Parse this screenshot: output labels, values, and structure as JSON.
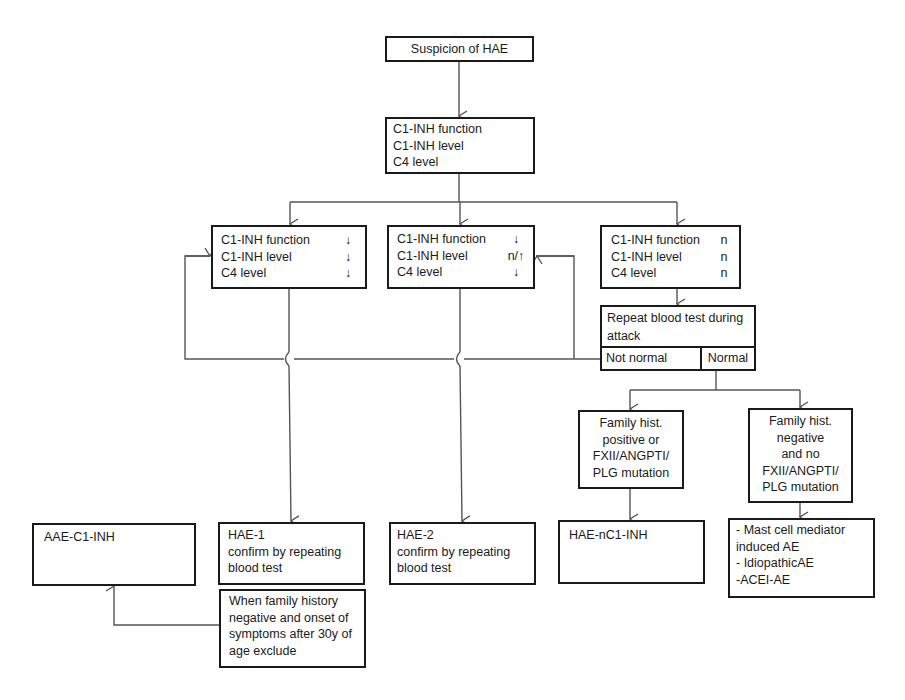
{
  "diagram": {
    "type": "flowchart",
    "nodes": {
      "suspicion": {
        "text": "Suspicion of HAE"
      },
      "initial_tests": {
        "lines": [
          "C1-INH function",
          "C1-INH level",
          "C4 level"
        ]
      },
      "result_type1": {
        "rows": [
          {
            "label": "C1-INH function",
            "value": "↓"
          },
          {
            "label": "C1-INH level",
            "value": "↓"
          },
          {
            "label": "C4 level",
            "value": "↓"
          }
        ]
      },
      "result_type2": {
        "rows": [
          {
            "label": "C1-INH function",
            "value": "↓"
          },
          {
            "label": "C1-INH level",
            "value": "n/↑"
          },
          {
            "label": "C4 level",
            "value": "↓"
          }
        ]
      },
      "result_normal": {
        "rows": [
          {
            "label": "C1-INH function",
            "value": "n"
          },
          {
            "label": "C1-INH level",
            "value": "n"
          },
          {
            "label": "C4 level",
            "value": "n"
          }
        ]
      },
      "repeat_test": {
        "lines": [
          "Repeat blood test during",
          "attack"
        ],
        "not_normal": "Not normal",
        "normal": "Normal"
      },
      "family_positive": {
        "lines": [
          "Family hist.",
          "positive or",
          "FXII/ANGPTI/",
          "PLG mutation"
        ]
      },
      "family_negative": {
        "lines": [
          "Family hist.",
          "negative",
          "and no",
          "FXII/ANGPTI/",
          "PLG mutation"
        ]
      },
      "aae": {
        "lines": [
          "AAE-C1-INH"
        ]
      },
      "hae1": {
        "lines": [
          "HAE-1",
          "confirm by repeating",
          "blood test"
        ]
      },
      "hae1_exclusion": {
        "lines": [
          "When family history",
          "negative and onset of",
          "symptoms after 30y of",
          "age exclude"
        ]
      },
      "hae2": {
        "lines": [
          "HAE-2",
          "confirm by repeating",
          "blood test"
        ]
      },
      "hae_nc1": {
        "lines": [
          "HAE-nC1-INH"
        ]
      },
      "other_ae": {
        "lines": [
          "- Mast cell mediator",
          "induced AE",
          "- IdiopathicAE",
          "-ACEI-AE"
        ]
      }
    },
    "edges": [
      {
        "from": "suspicion",
        "to": "initial_tests"
      },
      {
        "from": "initial_tests",
        "to": "result_type1"
      },
      {
        "from": "initial_tests",
        "to": "result_type2"
      },
      {
        "from": "initial_tests",
        "to": "result_normal"
      },
      {
        "from": "result_normal",
        "to": "repeat_test"
      },
      {
        "from": "repeat_test.not_normal",
        "to": "result_type1"
      },
      {
        "from": "repeat_test.not_normal",
        "to": "result_type2"
      },
      {
        "from": "repeat_test.normal",
        "to": "family_positive"
      },
      {
        "from": "repeat_test.normal",
        "to": "family_negative"
      },
      {
        "from": "result_type1",
        "to": "hae1"
      },
      {
        "from": "result_type2",
        "to": "hae2"
      },
      {
        "from": "family_positive",
        "to": "hae_nc1"
      },
      {
        "from": "family_negative",
        "to": "other_ae"
      },
      {
        "from": "hae1_exclusion",
        "to": "aae"
      }
    ],
    "colors": {
      "line": "#555555",
      "border": "#1a1a1a",
      "text": "#1a1a1a",
      "background": "#ffffff"
    }
  }
}
